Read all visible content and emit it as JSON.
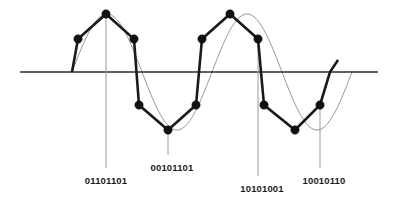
{
  "figure": {
    "background_color": "#ffffff"
  },
  "axis": {
    "name": "zero-amplitude-axis",
    "x_start": 20,
    "x_end": 378,
    "y": 72,
    "color": "#2b2b2b",
    "stroke_width": 1.6
  },
  "sine": {
    "name": "reference-analog-sine",
    "color": "#8c8c8c",
    "stroke_width": 0.9,
    "amplitude": 58,
    "baseline_y": 72,
    "x_start": 72,
    "x_end": 352,
    "period": 140
  },
  "waveform": {
    "name": "quantized-pcm-polyline",
    "color": "#1a1a1a",
    "stroke_width": 2.6,
    "points": [
      {
        "x": 72,
        "y": 72
      },
      {
        "x": 78,
        "y": 39
      },
      {
        "x": 106,
        "y": 14
      },
      {
        "x": 134,
        "y": 39
      },
      {
        "x": 139,
        "y": 105
      },
      {
        "x": 168,
        "y": 130
      },
      {
        "x": 196,
        "y": 105
      },
      {
        "x": 202,
        "y": 39
      },
      {
        "x": 230,
        "y": 14
      },
      {
        "x": 258,
        "y": 39
      },
      {
        "x": 264,
        "y": 105
      },
      {
        "x": 295,
        "y": 130
      },
      {
        "x": 320,
        "y": 105
      },
      {
        "x": 330,
        "y": 72
      },
      {
        "x": 338,
        "y": 60
      }
    ]
  },
  "sample_dots": {
    "name": "sample-points",
    "radius": 4.2,
    "color": "#111111",
    "points": [
      {
        "x": 78,
        "y": 39
      },
      {
        "x": 106,
        "y": 14
      },
      {
        "x": 134,
        "y": 39
      },
      {
        "x": 139,
        "y": 105
      },
      {
        "x": 168,
        "y": 130
      },
      {
        "x": 196,
        "y": 105
      },
      {
        "x": 202,
        "y": 39
      },
      {
        "x": 230,
        "y": 14
      },
      {
        "x": 258,
        "y": 39
      },
      {
        "x": 264,
        "y": 105
      },
      {
        "x": 295,
        "y": 130
      },
      {
        "x": 320,
        "y": 105
      }
    ]
  },
  "leaders": [
    {
      "name": "leader-line-1",
      "x": 106,
      "y_top": 14,
      "y_bottom": 168
    },
    {
      "name": "leader-line-2",
      "x": 168,
      "y_top": 130,
      "y_bottom": 155
    },
    {
      "name": "leader-line-3",
      "x": 258,
      "y_top": 39,
      "y_bottom": 176
    },
    {
      "name": "leader-line-4",
      "x": 320,
      "y_top": 105,
      "y_bottom": 168
    }
  ],
  "labels": [
    {
      "name": "binary-code-label-1",
      "text": "01101101",
      "x": 106,
      "y": 176
    },
    {
      "name": "binary-code-label-2",
      "text": "00101101",
      "x": 172,
      "y": 163
    },
    {
      "name": "binary-code-label-3",
      "text": "10101001",
      "x": 262,
      "y": 184
    },
    {
      "name": "binary-code-label-4",
      "text": "10010110",
      "x": 324,
      "y": 176
    }
  ]
}
